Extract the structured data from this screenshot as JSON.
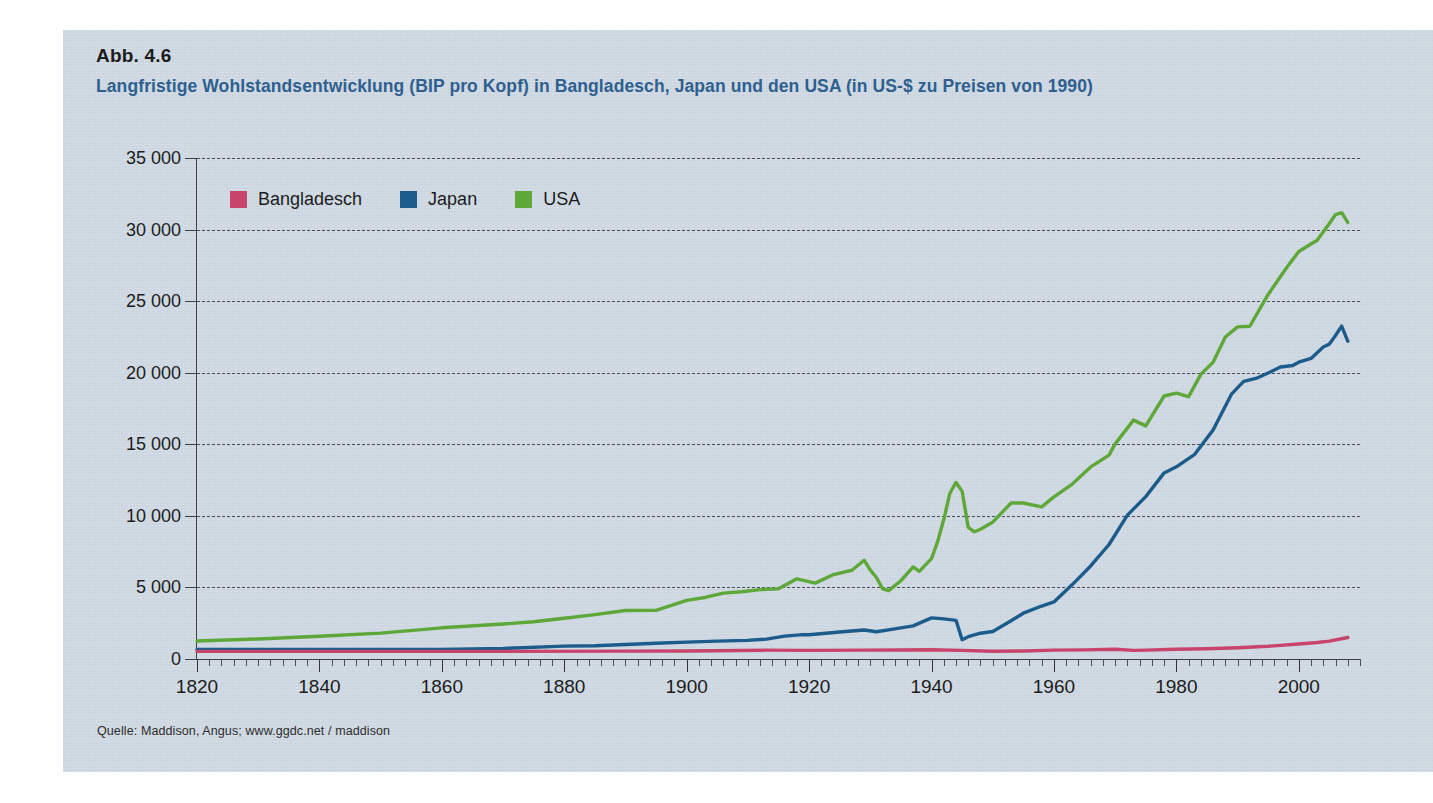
{
  "figure": {
    "number": "Abb. 4.6",
    "title": "Langfristige Wohlstandsentwicklung (BIP pro Kopf) in Bangladesch, Japan und den USA (in US-$ zu Preisen von 1990)",
    "source": "Quelle: Maddison, Angus; www.ggdc.net / maddison"
  },
  "colors": {
    "panel_background": "#ccd6e0",
    "title_blue": "#2e5f8f",
    "bangladesch": "#c9446b",
    "japan": "#1b5c8c",
    "usa": "#5da838",
    "gridline": "#4a4f55",
    "axis": "#3b4046"
  },
  "legend": {
    "position": "top-left-inside-plot",
    "items": [
      {
        "label": "Bangladesch",
        "color": "#c9446b"
      },
      {
        "label": "Japan",
        "color": "#1b5c8c"
      },
      {
        "label": "USA",
        "color": "#5da838"
      }
    ]
  },
  "chart_data": {
    "type": "line",
    "title": "Langfristige Wohlstandsentwicklung (BIP pro Kopf) in Bangladesch, Japan und den USA (in US-$ zu Preisen von 1990)",
    "xlabel": "",
    "ylabel": "",
    "xlim": [
      1820,
      2010
    ],
    "ylim": [
      0,
      35000
    ],
    "grid": true,
    "y_ticks": [
      0,
      5000,
      10000,
      15000,
      20000,
      25000,
      30000,
      35000
    ],
    "y_tick_labels": [
      "0",
      "5 000",
      "10 000",
      "15 000",
      "20 000",
      "25 000",
      "30 000",
      "35 000"
    ],
    "x_ticks": [
      1820,
      1840,
      1860,
      1880,
      1900,
      1920,
      1940,
      1960,
      1980,
      2000
    ],
    "x_tick_labels": [
      "1820",
      "1840",
      "1860",
      "1880",
      "1900",
      "1920",
      "1940",
      "1960",
      "1980",
      "2000"
    ],
    "x_minor_tick_step": 2,
    "units": "US-$ (1990 prices) per capita",
    "series": [
      {
        "name": "USA",
        "color": "#5da838",
        "x": [
          1820,
          1830,
          1840,
          1850,
          1860,
          1870,
          1875,
          1880,
          1885,
          1890,
          1895,
          1900,
          1903,
          1906,
          1909,
          1912,
          1915,
          1918,
          1921,
          1924,
          1927,
          1929,
          1930,
          1931,
          1932,
          1933,
          1935,
          1937,
          1938,
          1940,
          1941,
          1942,
          1943,
          1944,
          1945,
          1946,
          1947,
          1948,
          1950,
          1953,
          1955,
          1958,
          1960,
          1963,
          1966,
          1969,
          1970,
          1973,
          1975,
          1978,
          1980,
          1982,
          1984,
          1986,
          1988,
          1990,
          1992,
          1995,
          1998,
          2000,
          2003,
          2005,
          2006,
          2007,
          2008
        ],
        "y": [
          1257,
          1400,
          1588,
          1806,
          2178,
          2445,
          2600,
          2850,
          3100,
          3392,
          3400,
          4091,
          4300,
          4600,
          4700,
          4850,
          4900,
          5600,
          5300,
          5900,
          6200,
          6899,
          6213,
          5691,
          4908,
          4777,
          5467,
          6430,
          6126,
          7010,
          8206,
          9741,
          11581,
          12333,
          11709,
          9197,
          8886,
          9065,
          9561,
          10897,
          10897,
          10631,
          11328,
          12222,
          13419,
          14243,
          15030,
          16689,
          16284,
          18373,
          18577,
          18325,
          19884,
          20731,
          22499,
          23201,
          23247,
          25467,
          27331,
          28467,
          29250,
          30424,
          31049,
          31178,
          30500
        ],
        "notes": "WWII peak ~12,333 in 1944; Great Depression trough ~4,777 in 1933; peak ~31,800 around 2006-2007"
      },
      {
        "name": "Japan",
        "color": "#1b5c8c",
        "x": [
          1820,
          1840,
          1860,
          1870,
          1880,
          1885,
          1890,
          1895,
          1900,
          1905,
          1910,
          1913,
          1916,
          1919,
          1920,
          1925,
          1929,
          1931,
          1934,
          1937,
          1940,
          1942,
          1944,
          1945,
          1946,
          1948,
          1950,
          1953,
          1955,
          1958,
          1960,
          1963,
          1966,
          1969,
          1972,
          1975,
          1978,
          1980,
          1983,
          1986,
          1989,
          1991,
          1993,
          1995,
          1997,
          1999,
          2000,
          2002,
          2004,
          2005,
          2006,
          2007,
          2008
        ],
        "y": [
          669,
          669,
          669,
          737,
          900,
          930,
          1012,
          1100,
          1180,
          1250,
          1304,
          1387,
          1600,
          1700,
          1696,
          1885,
          2026,
          1900,
          2100,
          2315,
          2874,
          2800,
          2700,
          1346,
          1555,
          1800,
          1921,
          2670,
          3200,
          3700,
          3986,
          5200,
          6500,
          8000,
          10050,
          11344,
          13000,
          13428,
          14300,
          16000,
          18500,
          19400,
          19600,
          19979,
          20400,
          20500,
          20738,
          21000,
          21800,
          22000,
          22600,
          23259,
          22200
        ],
        "notes": "Sharp WWII collapse from ~2,874 (1940) to ~1,346 (1945); rapid postwar growth; stagnation after 1991 bubble"
      },
      {
        "name": "Bangladesch",
        "color": "#c9446b",
        "x": [
          1820,
          1850,
          1870,
          1890,
          1900,
          1913,
          1920,
          1929,
          1940,
          1945,
          1950,
          1955,
          1960,
          1965,
          1970,
          1973,
          1975,
          1980,
          1985,
          1990,
          1995,
          2000,
          2003,
          2005,
          2008
        ],
        "y": [
          533,
          533,
          533,
          550,
          560,
          617,
          600,
          620,
          650,
          600,
          540,
          560,
          620,
          640,
          680,
          600,
          620,
          680,
          720,
          790,
          890,
          1050,
          1150,
          1250,
          1500
        ],
        "notes": "Essentially flat near 500-700 until 1970s, then slow rise to ~1,500"
      }
    ]
  }
}
